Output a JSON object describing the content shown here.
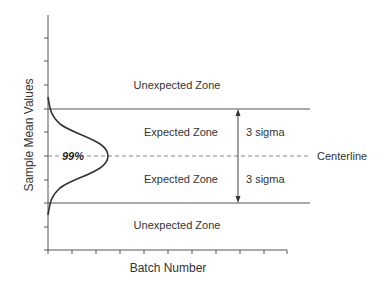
{
  "diagram": {
    "type": "control-chart-schematic",
    "y_axis_label": "Sample Mean Values",
    "x_axis_label": "Batch Number",
    "zones": {
      "upper_unexpected": "Unexpected Zone",
      "upper_expected": "Expected Zone",
      "lower_expected": "Expected Zone",
      "lower_unexpected": "Unexpected Zone"
    },
    "sigma_labels": {
      "upper": "3 sigma",
      "lower": "3 sigma"
    },
    "centerline_label": "Centerline",
    "distribution_label": "99%",
    "colors": {
      "line": "#555555",
      "curve": "#333333",
      "dashed": "#888888",
      "text": "#333333"
    }
  }
}
